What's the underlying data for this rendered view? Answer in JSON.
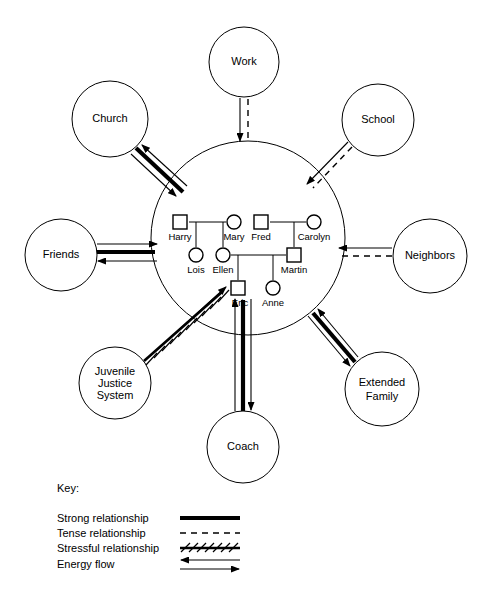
{
  "diagram": {
    "type": "ecomap",
    "family_circle": {
      "label": "",
      "cx": 248,
      "cy": 238,
      "r": 97
    },
    "external_nodes": [
      {
        "id": "work",
        "label": "Work",
        "lines": [
          "Work"
        ],
        "cx": 244,
        "cy": 62,
        "r": 35,
        "relationship": "tense",
        "flow": "inward",
        "target": "family"
      },
      {
        "id": "church",
        "label": "Church",
        "lines": [
          "Church"
        ],
        "cx": 110,
        "cy": 119,
        "r": 38,
        "relationship": "strong",
        "flow": "bidirectional",
        "target": "family"
      },
      {
        "id": "school",
        "label": "School",
        "lines": [
          "School"
        ],
        "cx": 378,
        "cy": 120,
        "r": 36,
        "relationship": "tense",
        "flow": "inward",
        "target": "family"
      },
      {
        "id": "friends",
        "label": "Friends",
        "lines": [
          "Friends"
        ],
        "cx": 61,
        "cy": 255,
        "r": 36,
        "relationship": "strong",
        "flow": "bidirectional",
        "target": "family"
      },
      {
        "id": "neighbors",
        "label": "Neighbors",
        "lines": [
          "Neighbors"
        ],
        "cx": 430,
        "cy": 256,
        "r": 37,
        "relationship": "tense",
        "flow": "inward",
        "target": "family"
      },
      {
        "id": "juvenile",
        "label": "Juvenile Justice System",
        "lines": [
          "Juvenile",
          "Justice",
          "System"
        ],
        "cx": 115,
        "cy": 383,
        "r": 36,
        "relationship": "stressful",
        "flow": "inward",
        "target": "eric"
      },
      {
        "id": "extended",
        "label": "Extended Family",
        "lines": [
          "Extended",
          "Family"
        ],
        "cx": 382,
        "cy": 389,
        "r": 37,
        "relationship": "strong",
        "flow": "bidirectional",
        "target": "family"
      },
      {
        "id": "coach",
        "label": "Coach",
        "lines": [
          "Coach"
        ],
        "cx": 243,
        "cy": 447,
        "r": 36,
        "relationship": "strong",
        "flow": "bidirectional",
        "target": "eric"
      }
    ],
    "genogram": {
      "persons": [
        {
          "id": "harry",
          "label": "Harry",
          "gender": "male",
          "x": 180,
          "y": 222
        },
        {
          "id": "mary",
          "label": "Mary",
          "gender": "female",
          "x": 234,
          "y": 222
        },
        {
          "id": "fred",
          "label": "Fred",
          "gender": "male",
          "x": 261,
          "y": 222
        },
        {
          "id": "carolyn",
          "label": "Carolyn",
          "gender": "female",
          "x": 314,
          "y": 222
        },
        {
          "id": "lois",
          "label": "Lois",
          "gender": "female",
          "x": 196,
          "y": 255
        },
        {
          "id": "ellen",
          "label": "Ellen",
          "gender": "female",
          "x": 223,
          "y": 255
        },
        {
          "id": "martin",
          "label": "Martin",
          "gender": "male",
          "x": 294,
          "y": 255
        },
        {
          "id": "eric",
          "label": "Eric",
          "gender": "male",
          "x": 238,
          "y": 288
        },
        {
          "id": "anne",
          "label": "Anne",
          "gender": "female",
          "x": 273,
          "y": 288
        }
      ],
      "couples": [
        {
          "partner_a": "harry",
          "partner_b": "mary",
          "children": [
            "lois",
            "ellen"
          ]
        },
        {
          "partner_a": "fred",
          "partner_b": "carolyn",
          "children": [
            "martin"
          ]
        },
        {
          "partner_a": "ellen",
          "partner_b": "martin",
          "children": [
            "eric",
            "anne"
          ]
        }
      ]
    }
  },
  "key": {
    "title": "Key:",
    "items": [
      {
        "id": "strong",
        "label": "Strong relationship",
        "style": "strong"
      },
      {
        "id": "tense",
        "label": "Tense relationship",
        "style": "tense"
      },
      {
        "id": "stressful",
        "label": "Stressful relationship",
        "style": "stressful"
      },
      {
        "id": "energy",
        "label": "Energy flow",
        "style": "energy"
      }
    ]
  }
}
